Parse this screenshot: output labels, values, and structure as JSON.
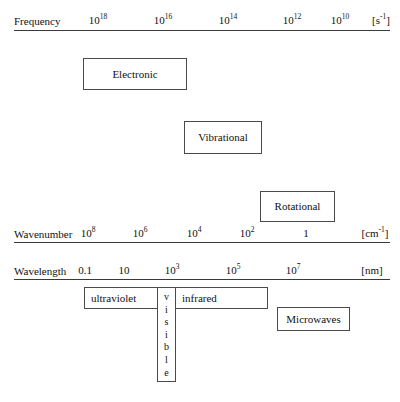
{
  "diagram": {
    "axes": [
      {
        "id": "frequency",
        "name": "Frequency",
        "unit": "s",
        "unit_exponent": "-1",
        "unit_bracketed": "[s-1]",
        "ticks": [
          {
            "mantissa": "10",
            "exponent": "18"
          },
          {
            "mantissa": "10",
            "exponent": "16"
          },
          {
            "mantissa": "10",
            "exponent": "14"
          },
          {
            "mantissa": "10",
            "exponent": "12"
          },
          {
            "mantissa": "10",
            "exponent": "10"
          }
        ]
      },
      {
        "id": "wavenumber",
        "name": "Wavenumber",
        "unit": "cm",
        "unit_exponent": "-1",
        "unit_bracketed": "[cm-1]",
        "ticks": [
          {
            "mantissa": "10",
            "exponent": "8"
          },
          {
            "mantissa": "10",
            "exponent": "6"
          },
          {
            "mantissa": "10",
            "exponent": "4"
          },
          {
            "mantissa": "10",
            "exponent": "2"
          },
          {
            "mantissa": "1",
            "exponent": ""
          }
        ]
      },
      {
        "id": "wavelength",
        "name": "Wavelength",
        "unit": "nm",
        "unit_exponent": "",
        "unit_bracketed": "[nm]",
        "ticks": [
          {
            "mantissa": "0.1",
            "exponent": ""
          },
          {
            "mantissa": "10",
            "exponent": ""
          },
          {
            "mantissa": "10",
            "exponent": "3"
          },
          {
            "mantissa": "10",
            "exponent": "5"
          },
          {
            "mantissa": "10",
            "exponent": "7"
          }
        ]
      }
    ],
    "excitation_boxes": [
      {
        "id": "electronic",
        "label": "Electronic"
      },
      {
        "id": "vibrational",
        "label": "Vibrational"
      },
      {
        "id": "rotational",
        "label": "Rotational"
      }
    ],
    "spectral_regions": [
      {
        "id": "ultraviolet",
        "label": "ultraviolet"
      },
      {
        "id": "visible",
        "label": "visible",
        "letters": [
          "v",
          "i",
          "s",
          "i",
          "b",
          "l",
          "e"
        ]
      },
      {
        "id": "infrared",
        "label": "infrared"
      },
      {
        "id": "microwaves",
        "label": "Microwaves"
      }
    ]
  },
  "colors": {
    "background": "#ffffff",
    "line": "#3a3a3a",
    "box_border": "#4a4a4a",
    "text": "#111111"
  }
}
